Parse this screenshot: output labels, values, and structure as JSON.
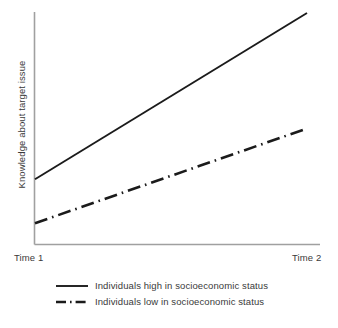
{
  "chart_data": {
    "type": "line",
    "title": "",
    "xlabel": "",
    "ylabel": "Knowledge about target issue",
    "x": [
      "Time 1",
      "Time 2"
    ],
    "xticklabels": [
      "Time 1",
      "Time 2"
    ],
    "yticklabels": [],
    "xlim": [
      0,
      1
    ],
    "ylim": [
      0,
      1
    ],
    "grid": false,
    "legend_position": "below",
    "annotations": [],
    "series": [
      {
        "name": "Individuals high in socioeconomic status",
        "values": [
          0.28,
          1.0
        ],
        "style": "solid",
        "color": "#1b1b1b",
        "legend_marker": "solid-line"
      },
      {
        "name": "Individuals low in socioeconomic status",
        "values": [
          0.09,
          0.5
        ],
        "style": "dash-dot",
        "color": "#1b1b1b",
        "legend_marker": "dash-dot-line"
      }
    ]
  },
  "axes": {
    "y_axis_label": "Knowledge about target issue",
    "x_tick_left": "Time 1",
    "x_tick_right": "Time 2",
    "axis_color": "#a0a0a0"
  },
  "legend": {
    "items": [
      {
        "label": "Individuals high in socioeconomic status",
        "marker": "solid-line"
      },
      {
        "label": "Individuals low in socioeconomic status",
        "marker": "dash-dot-line"
      }
    ]
  }
}
